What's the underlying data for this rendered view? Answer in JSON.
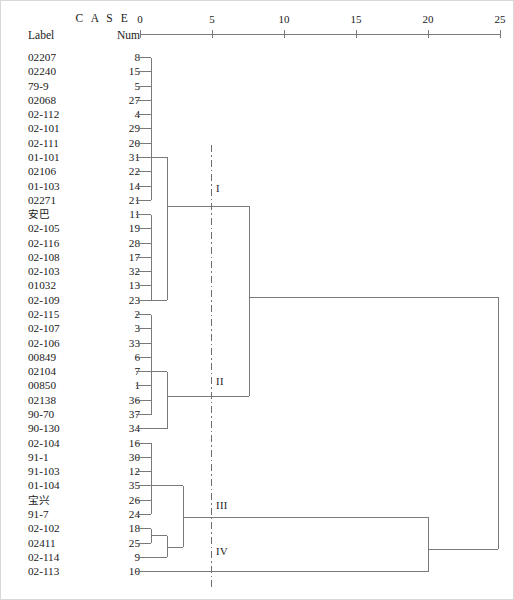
{
  "header": {
    "case_title": "C A S E",
    "label_col": "Label",
    "num_col": "Num"
  },
  "axis": {
    "ticks": [
      0,
      5,
      10,
      15,
      20,
      25
    ],
    "tick_labels": [
      "0",
      "5",
      "10",
      "15",
      "20",
      "25"
    ],
    "x_min": 0,
    "x_max": 25,
    "px_min": 140,
    "px_max": 500,
    "y_px": 34
  },
  "cut_line": {
    "value": 5,
    "style": "dash-dot",
    "x_px": 211,
    "y_top": 145,
    "y_bottom": 588
  },
  "cluster_tags": [
    {
      "name": "I",
      "x": 216,
      "y": 190
    },
    {
      "name": "II",
      "x": 216,
      "y": 383
    },
    {
      "name": "III",
      "x": 216,
      "y": 507
    },
    {
      "name": "IV",
      "x": 216,
      "y": 553
    }
  ],
  "leaves": [
    {
      "label": "02207",
      "num": "8",
      "cjk": false
    },
    {
      "label": "02240",
      "num": "15",
      "cjk": false
    },
    {
      "label": "79-9",
      "num": "5",
      "cjk": false
    },
    {
      "label": "02068",
      "num": "27",
      "cjk": false
    },
    {
      "label": "02-112",
      "num": "4",
      "cjk": false
    },
    {
      "label": "02-101",
      "num": "29",
      "cjk": false
    },
    {
      "label": "02-111",
      "num": "20",
      "cjk": false
    },
    {
      "label": "01-101",
      "num": "31",
      "cjk": false
    },
    {
      "label": "02106",
      "num": "22",
      "cjk": false
    },
    {
      "label": "01-103",
      "num": "14",
      "cjk": false
    },
    {
      "label": "02271",
      "num": "21",
      "cjk": false
    },
    {
      "label": "安巴",
      "num": "11",
      "cjk": true
    },
    {
      "label": "02-105",
      "num": "19",
      "cjk": false
    },
    {
      "label": "02-116",
      "num": "28",
      "cjk": false
    },
    {
      "label": "02-108",
      "num": "17",
      "cjk": false
    },
    {
      "label": "02-103",
      "num": "32",
      "cjk": false
    },
    {
      "label": "01032",
      "num": "13",
      "cjk": false
    },
    {
      "label": "02-109",
      "num": "23",
      "cjk": false
    },
    {
      "label": "02-115",
      "num": "2",
      "cjk": false
    },
    {
      "label": "02-107",
      "num": "3",
      "cjk": false
    },
    {
      "label": "02-106",
      "num": "33",
      "cjk": false
    },
    {
      "label": "00849",
      "num": "6",
      "cjk": false
    },
    {
      "label": "02104",
      "num": "7",
      "cjk": false
    },
    {
      "label": "00850",
      "num": "1",
      "cjk": false
    },
    {
      "label": "02138",
      "num": "36",
      "cjk": false
    },
    {
      "label": "90-70",
      "num": "37",
      "cjk": false
    },
    {
      "label": "90-130",
      "num": "34",
      "cjk": false
    },
    {
      "label": "02-104",
      "num": "16",
      "cjk": false
    },
    {
      "label": "91-1",
      "num": "30",
      "cjk": false
    },
    {
      "label": "91-103",
      "num": "12",
      "cjk": false
    },
    {
      "label": "01-104",
      "num": "35",
      "cjk": false
    },
    {
      "label": "宝兴",
      "num": "26",
      "cjk": true
    },
    {
      "label": "91-7",
      "num": "24",
      "cjk": false
    },
    {
      "label": "02-102",
      "num": "18",
      "cjk": false
    },
    {
      "label": "02411",
      "num": "25",
      "cjk": false
    },
    {
      "label": "02-114",
      "num": "9",
      "cjk": false
    },
    {
      "label": "02-113",
      "num": "10",
      "cjk": false
    }
  ],
  "chart_data": {
    "type": "dendrogram",
    "title": "C A S E",
    "xlabel": "Rescaled Distance Cluster Combine",
    "axis_range": [
      0,
      25
    ],
    "axis_ticks": [
      0,
      5,
      10,
      15,
      20,
      25
    ],
    "n_leaves": 37,
    "leaf_order": [
      "02207",
      "02240",
      "79-9",
      "02068",
      "02-112",
      "02-101",
      "02-111",
      "01-101",
      "02106",
      "01-103",
      "02271",
      "安巴",
      "02-105",
      "02-116",
      "02-108",
      "02-103",
      "01032",
      "02-109",
      "02-115",
      "02-107",
      "02-106",
      "00849",
      "02104",
      "00850",
      "02138",
      "90-70",
      "90-130",
      "02-104",
      "91-1",
      "91-103",
      "01-104",
      "宝兴",
      "91-7",
      "02-102",
      "02411",
      "02-114",
      "02-113"
    ],
    "leaf_nums": [
      8,
      15,
      5,
      27,
      4,
      29,
      20,
      31,
      22,
      14,
      21,
      11,
      19,
      28,
      17,
      32,
      13,
      23,
      2,
      3,
      33,
      6,
      7,
      1,
      36,
      37,
      34,
      16,
      30,
      12,
      35,
      26,
      24,
      18,
      25,
      9,
      10
    ],
    "cut_at": 5,
    "clusters": [
      {
        "name": "I",
        "members": [
          "02207",
          "02240",
          "79-9",
          "02068",
          "02-112",
          "02-101",
          "02-111",
          "01-101",
          "02106",
          "01-103",
          "02271",
          "安巴",
          "02-105",
          "02-116",
          "02-108",
          "02-103",
          "01032",
          "02-109"
        ]
      },
      {
        "name": "II",
        "members": [
          "02-115",
          "02-107",
          "02-106",
          "00849",
          "02104",
          "00850",
          "02138",
          "90-70",
          "90-130"
        ]
      },
      {
        "name": "III",
        "members": [
          "02-104",
          "91-1",
          "91-103",
          "01-104",
          "宝兴",
          "91-7",
          "02-102",
          "02411",
          "02-114"
        ]
      },
      {
        "name": "IV",
        "members": [
          "02-113"
        ]
      }
    ],
    "merge_heights": {
      "cluster_I_inner": 1.05,
      "cluster_I_outer": 1.9,
      "cluster_I_join": 7.6,
      "cluster_II_inner": 1.05,
      "cluster_II_outer": 1.9,
      "I_II_join": 7.6,
      "cluster_III_a": 1.9,
      "cluster_III_b": 1.05,
      "cluster_III_join": 3.9,
      "III_IV_join": 18.6,
      "root": 24.9
    },
    "stroke_color": "#7a7a7a"
  }
}
